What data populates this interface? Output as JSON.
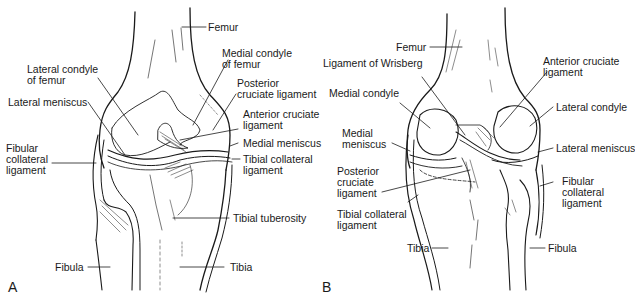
{
  "figure": {
    "panels": [
      {
        "id": "A",
        "letter": "A",
        "view": "anterior",
        "labels": {
          "femur": "Femur",
          "medial_condyle_femur": "Medial condyle of femur",
          "lateral_condyle_femur": "Lateral condyle of femur",
          "posterior_cruciate": "Posterior cruciate ligament",
          "lateral_meniscus": "Lateral meniscus",
          "anterior_cruciate": "Anterior cruciate ligament",
          "medial_meniscus": "Medial meniscus",
          "fibular_collateral": "Fibular collateral ligament",
          "tibial_collateral": "Tibial collateral ligament",
          "tibial_tuberosity": "Tibial tuberosity",
          "fibula": "Fibula",
          "tibia": "Tibia"
        }
      },
      {
        "id": "B",
        "letter": "B",
        "view": "posterior",
        "labels": {
          "femur": "Femur",
          "ligament_wrisberg": "Ligament of Wrisberg",
          "anterior_cruciate": "Anterior cruciate ligament",
          "medial_condyle": "Medial condyle",
          "lateral_condyle": "Lateral condyle",
          "medial_meniscus": "Medial meniscus",
          "lateral_meniscus": "Lateral meniscus",
          "posterior_cruciate": "Posterior cruciate ligament",
          "fibular_collateral": "Fibular collateral ligament",
          "tibial_collateral": "Tibial collateral ligament",
          "tibia": "Tibia",
          "fibula": "Fibula"
        }
      }
    ],
    "colors": {
      "line": "#1a1a1a",
      "background": "#ffffff"
    }
  }
}
